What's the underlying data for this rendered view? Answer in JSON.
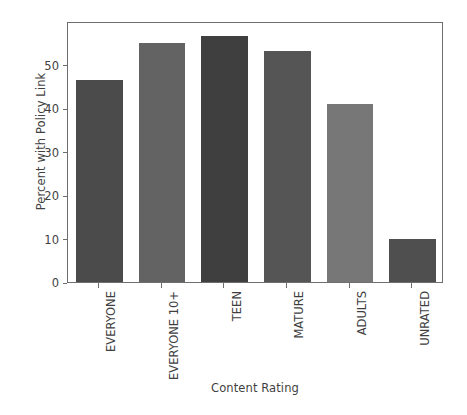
{
  "chart_data": {
    "type": "bar",
    "title": "",
    "xlabel": "Content Rating",
    "ylabel": "Percent with Policy Link",
    "categories": [
      "EVERYONE",
      "EVERYONE 10+",
      "TEEN",
      "MATURE",
      "ADULTS",
      "UNRATED"
    ],
    "values": [
      46.5,
      55.0,
      56.5,
      53.0,
      41.0,
      9.8
    ],
    "bar_colors": [
      "#4b4b4b",
      "#636363",
      "#3f3f3f",
      "#555555",
      "#777777",
      "#4f4f4f"
    ],
    "ylim": [
      0,
      60
    ],
    "yticks": [
      0,
      10,
      20,
      30,
      40,
      50
    ],
    "ytick_labels": [
      "0",
      "10",
      "20",
      "30",
      "40",
      "50"
    ],
    "grid": false,
    "legend": false,
    "legend_position": "none",
    "axis_color": "#6e6e6e",
    "text_color": "#3f3f3f",
    "background": "#ffffff"
  }
}
